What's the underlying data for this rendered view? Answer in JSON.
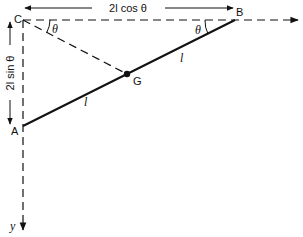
{
  "diagram": {
    "type": "physics-ladder-rod",
    "points": {
      "C": {
        "label": "C",
        "x": 23,
        "y": 20
      },
      "B": {
        "label": "B",
        "x": 235,
        "y": 20
      },
      "A": {
        "label": "A",
        "x": 23,
        "y": 126
      },
      "G": {
        "label": "G",
        "x": 127,
        "y": 74
      }
    },
    "labels": {
      "C": "C",
      "B": "B",
      "A": "A",
      "G": "G",
      "theta_at_C": "θ",
      "theta_at_B": "θ",
      "segment_GB": "l",
      "segment_AG": "l",
      "horizontal_dimension": "2l cos θ",
      "vertical_dimension": "2l sin θ",
      "y_axis": "y"
    },
    "colors": {
      "line": "#111111",
      "background": "#ffffff"
    }
  }
}
